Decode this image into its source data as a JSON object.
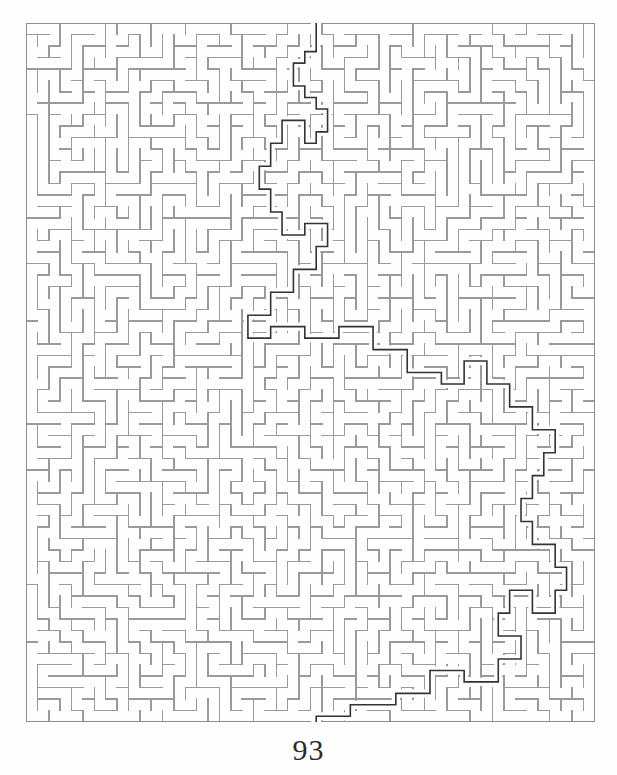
{
  "document": {
    "type": "puzzle-book-page",
    "page_number": "93",
    "figure_caption": "",
    "background_color": "#fefefe"
  },
  "maze": {
    "title": "",
    "name": "rectangular-grid-maze-with-solution",
    "columns": 50,
    "rows": 61,
    "cell_size": 11.38,
    "wall_color": "#9a9a9a",
    "wall_width": 1.5,
    "border_color": "#8f8f8f",
    "border_width": 1.8,
    "solution_color": "#333333",
    "solution_width": 1.6,
    "entrance": {
      "side": "top",
      "column": 25,
      "label": "start"
    },
    "exit": {
      "side": "bottom",
      "column": 25,
      "label": "finish"
    },
    "solution_waypoints": [
      [
        25,
        -1
      ],
      [
        25,
        1
      ],
      [
        25,
        2
      ],
      [
        24,
        2
      ],
      [
        24,
        3
      ],
      [
        23,
        3
      ],
      [
        23,
        5
      ],
      [
        24,
        5
      ],
      [
        24,
        6
      ],
      [
        25,
        6
      ],
      [
        25,
        7
      ],
      [
        26,
        7
      ],
      [
        26,
        9
      ],
      [
        25,
        9
      ],
      [
        25,
        10
      ],
      [
        24,
        10
      ],
      [
        24,
        8
      ],
      [
        22,
        8
      ],
      [
        22,
        10
      ],
      [
        21,
        10
      ],
      [
        21,
        12
      ],
      [
        20,
        12
      ],
      [
        20,
        14
      ],
      [
        21,
        14
      ],
      [
        21,
        16
      ],
      [
        22,
        16
      ],
      [
        22,
        18
      ],
      [
        24,
        18
      ],
      [
        24,
        17
      ],
      [
        26,
        17
      ],
      [
        26,
        19
      ],
      [
        25,
        19
      ],
      [
        25,
        21
      ],
      [
        23,
        21
      ],
      [
        23,
        23
      ],
      [
        21,
        23
      ],
      [
        21,
        25
      ],
      [
        19,
        25
      ],
      [
        19,
        27
      ],
      [
        21,
        27
      ],
      [
        21,
        26
      ],
      [
        24,
        26
      ],
      [
        24,
        27
      ],
      [
        27,
        27
      ],
      [
        27,
        26
      ],
      [
        30,
        26
      ],
      [
        30,
        28
      ],
      [
        33,
        28
      ],
      [
        33,
        30
      ],
      [
        36,
        30
      ],
      [
        36,
        31
      ],
      [
        38,
        31
      ],
      [
        38,
        29
      ],
      [
        40,
        29
      ],
      [
        40,
        31
      ],
      [
        42,
        31
      ],
      [
        42,
        33
      ],
      [
        44,
        33
      ],
      [
        44,
        35
      ],
      [
        46,
        35
      ],
      [
        46,
        37
      ],
      [
        45,
        37
      ],
      [
        45,
        39
      ],
      [
        44,
        39
      ],
      [
        44,
        41
      ],
      [
        43,
        41
      ],
      [
        43,
        43
      ],
      [
        44,
        43
      ],
      [
        44,
        45
      ],
      [
        46,
        45
      ],
      [
        46,
        47
      ],
      [
        47,
        47
      ],
      [
        47,
        49
      ],
      [
        46,
        49
      ],
      [
        46,
        51
      ],
      [
        44,
        51
      ],
      [
        44,
        49
      ],
      [
        42,
        49
      ],
      [
        42,
        51
      ],
      [
        41,
        51
      ],
      [
        41,
        53
      ],
      [
        43,
        53
      ],
      [
        43,
        55
      ],
      [
        41,
        55
      ],
      [
        41,
        57
      ],
      [
        38,
        57
      ],
      [
        38,
        56
      ],
      [
        35,
        56
      ],
      [
        35,
        58
      ],
      [
        32,
        58
      ],
      [
        32,
        59
      ],
      [
        28,
        59
      ],
      [
        28,
        60
      ],
      [
        25,
        60
      ],
      [
        25,
        62
      ]
    ]
  },
  "colors": {
    "page_background": "#fefefe",
    "maze_wall": "#9a9a9a",
    "maze_solution": "#333333",
    "page_number_text": "#2b2b2b"
  },
  "accessibility": {
    "maze_alt": "Rectangular maze puzzle, 50 columns by 61 rows, with solution path traced in dark gray from the top entrance to the bottom exit",
    "page_number_label": "Page number"
  }
}
